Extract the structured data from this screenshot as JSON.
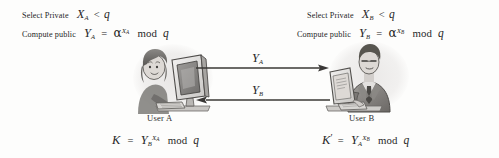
{
  "diagram": {
    "background_color": "#fdfdfc",
    "ink_color": "#2b2b2b"
  },
  "left_party": {
    "select_private": {
      "text_prefix": "Select Private",
      "variable": "X",
      "subscript": "A",
      "relation": "<",
      "modulus": "q"
    },
    "compute_public": {
      "text_prefix": "Compute public",
      "variable": "Y",
      "subscript": "A",
      "equals": "=",
      "base": "α",
      "exponent_variable": "X",
      "exponent_subscript": "A",
      "mod_text": "mod",
      "modulus": "q"
    },
    "caption": "User A",
    "shared_key": {
      "key_symbol": "K",
      "equals": "=",
      "base_variable": "Y",
      "base_subscript": "B",
      "exponent_variable": "X",
      "exponent_subscript": "A",
      "mod_text": "mod",
      "modulus": "q"
    },
    "figure_name": "woman-at-computer-illustration"
  },
  "right_party": {
    "select_private": {
      "text_prefix": "Select Private",
      "variable": "X",
      "subscript": "B",
      "relation": "<",
      "modulus": "q"
    },
    "compute_public": {
      "text_prefix": "Compute public",
      "variable": "Y",
      "subscript": "B",
      "equals": "=",
      "base": "α",
      "exponent_variable": "X",
      "exponent_subscript": "B",
      "mod_text": "mod",
      "modulus": "q"
    },
    "caption": "User B",
    "shared_key": {
      "key_symbol": "K",
      "prime": "′",
      "equals": "=",
      "base_variable": "Y",
      "base_subscript": "A",
      "exponent_variable": "X",
      "exponent_subscript": "B",
      "mod_text": "mod",
      "modulus": "q"
    },
    "figure_name": "man-at-computer-illustration"
  },
  "arrows": {
    "top": {
      "direction": "right",
      "label_variable": "Y",
      "label_subscript": "A",
      "icon": "arrow-right-icon"
    },
    "bottom": {
      "direction": "left",
      "label_variable": "Y",
      "label_subscript": "B",
      "icon": "arrow-left-icon"
    }
  }
}
